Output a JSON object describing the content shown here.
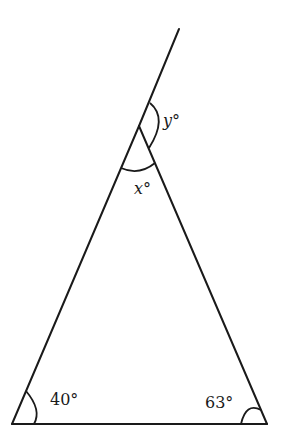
{
  "diagram": {
    "type": "triangle-with-extended-side",
    "labels": {
      "base_left_angle": "40°",
      "base_right_angle": "63°",
      "apex_interior_angle": "x°",
      "exterior_angle": "y°"
    },
    "colors": {
      "stroke": "#1a1a1a",
      "background": "#ffffff"
    }
  }
}
